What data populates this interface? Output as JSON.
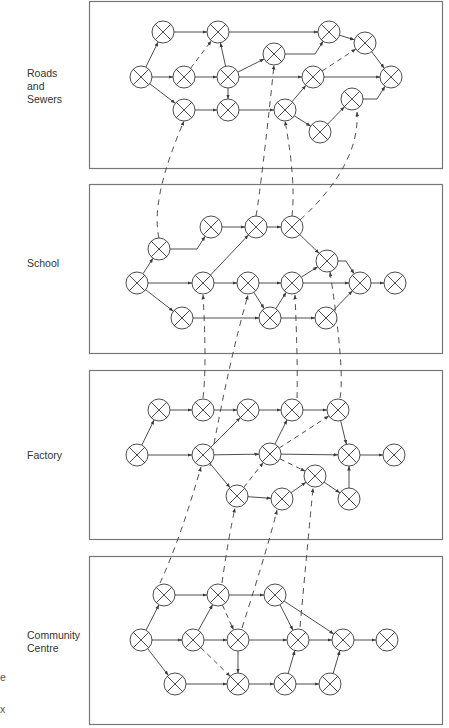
{
  "panels": [
    {
      "id": "roads",
      "label_lines": [
        "Roads",
        "and",
        "Sewers"
      ],
      "box": [
        89,
        1,
        353,
        167
      ],
      "label_pos": [
        27,
        67
      ],
      "nodes": {
        "A": [
          141,
          77
        ],
        "B": [
          163,
          32
        ],
        "C": [
          218,
          32
        ],
        "D": [
          184,
          77
        ],
        "E": [
          228,
          77
        ],
        "F": [
          184,
          110
        ],
        "G": [
          228,
          110
        ],
        "H": [
          274,
          54
        ],
        "I": [
          329,
          32
        ],
        "J": [
          313,
          77
        ],
        "K": [
          285,
          110
        ],
        "L": [
          365,
          43
        ],
        "M": [
          391,
          77
        ],
        "N": [
          352,
          99
        ],
        "O": [
          320,
          132
        ]
      },
      "edges": [
        [
          "A",
          "B"
        ],
        [
          "A",
          "D"
        ],
        [
          "A",
          "F"
        ],
        [
          "B",
          "C"
        ],
        [
          "D",
          "E"
        ],
        [
          "E",
          "C"
        ],
        [
          "E",
          "G"
        ],
        [
          "E",
          "H"
        ],
        [
          "E",
          "J"
        ],
        [
          "C",
          "I",
          "elbow"
        ],
        [
          "H",
          "I",
          "elbow"
        ],
        [
          "I",
          "L"
        ],
        [
          "L",
          "M"
        ],
        [
          "J",
          "M"
        ],
        [
          "F",
          "G"
        ],
        [
          "G",
          "K"
        ],
        [
          "K",
          "J"
        ],
        [
          "K",
          "O"
        ],
        [
          "O",
          "N"
        ],
        [
          "N",
          "M",
          "elbow"
        ]
      ],
      "dashed": [
        [
          "D",
          "C"
        ],
        [
          "J",
          "L"
        ]
      ]
    },
    {
      "id": "school",
      "label_lines": [
        "School"
      ],
      "box": [
        89,
        184,
        353,
        169
      ],
      "label_pos": [
        27,
        257
      ],
      "nodes": {
        "A": [
          137,
          283
        ],
        "B": [
          159,
          249
        ],
        "C": [
          182,
          318
        ],
        "D": [
          211,
          227
        ],
        "E": [
          203,
          283
        ],
        "F": [
          256,
          227
        ],
        "G": [
          248,
          283
        ],
        "H": [
          270,
          318
        ],
        "I": [
          292,
          227
        ],
        "J": [
          292,
          283
        ],
        "K": [
          327,
          261
        ],
        "L": [
          326,
          318
        ],
        "M": [
          360,
          283
        ],
        "N": [
          395,
          283
        ]
      },
      "edges": [
        [
          "A",
          "B"
        ],
        [
          "A",
          "E"
        ],
        [
          "A",
          "C"
        ],
        [
          "B",
          "D",
          "elbow"
        ],
        [
          "D",
          "F"
        ],
        [
          "F",
          "I"
        ],
        [
          "E",
          "F"
        ],
        [
          "E",
          "G"
        ],
        [
          "G",
          "J"
        ],
        [
          "G",
          "H"
        ],
        [
          "C",
          "H"
        ],
        [
          "H",
          "J"
        ],
        [
          "H",
          "L"
        ],
        [
          "J",
          "K"
        ],
        [
          "J",
          "M"
        ],
        [
          "I",
          "K"
        ],
        [
          "K",
          "M",
          "elbow"
        ],
        [
          "L",
          "M"
        ],
        [
          "M",
          "N"
        ]
      ],
      "dashed": []
    },
    {
      "id": "factory",
      "label_lines": [
        "Factory"
      ],
      "box": [
        89,
        370,
        353,
        169
      ],
      "label_pos": [
        27,
        449
      ],
      "nodes": {
        "A": [
          137,
          455
        ],
        "B": [
          159,
          410
        ],
        "C": [
          203,
          410
        ],
        "D": [
          203,
          455
        ],
        "E": [
          248,
          410
        ],
        "F": [
          237,
          496
        ],
        "G": [
          292,
          410
        ],
        "H": [
          270,
          454
        ],
        "I": [
          282,
          499
        ],
        "J": [
          338,
          410
        ],
        "K": [
          315,
          476
        ],
        "L": [
          349,
          455
        ],
        "M": [
          349,
          499
        ],
        "N": [
          394,
          455
        ]
      },
      "edges": [
        [
          "A",
          "B"
        ],
        [
          "A",
          "D"
        ],
        [
          "B",
          "C"
        ],
        [
          "C",
          "E"
        ],
        [
          "D",
          "E"
        ],
        [
          "D",
          "H"
        ],
        [
          "D",
          "F"
        ],
        [
          "E",
          "G"
        ],
        [
          "G",
          "J"
        ],
        [
          "H",
          "G"
        ],
        [
          "H",
          "L"
        ],
        [
          "J",
          "L"
        ],
        [
          "F",
          "I"
        ],
        [
          "I",
          "K"
        ],
        [
          "K",
          "M"
        ],
        [
          "M",
          "L"
        ],
        [
          "L",
          "N"
        ]
      ],
      "dashed": [
        [
          "H",
          "J"
        ],
        [
          "H",
          "K"
        ],
        [
          "F",
          "H"
        ]
      ]
    },
    {
      "id": "community",
      "label_lines": [
        "Community",
        "Centre"
      ],
      "box": [
        89,
        556,
        353,
        168
      ],
      "label_pos": [
        27,
        629
      ],
      "nodes": {
        "A": [
          141,
          640
        ],
        "B": [
          164,
          595
        ],
        "C": [
          175,
          684
        ],
        "D": [
          193,
          640
        ],
        "E": [
          218,
          595
        ],
        "F": [
          238,
          640
        ],
        "G": [
          238,
          684
        ],
        "H": [
          275,
          595
        ],
        "I": [
          285,
          684
        ],
        "J": [
          298,
          640
        ],
        "K": [
          330,
          684
        ],
        "L": [
          343,
          640
        ],
        "M": [
          387,
          640
        ]
      },
      "edges": [
        [
          "A",
          "B"
        ],
        [
          "A",
          "D"
        ],
        [
          "A",
          "C"
        ],
        [
          "B",
          "E"
        ],
        [
          "D",
          "E"
        ],
        [
          "D",
          "F"
        ],
        [
          "E",
          "H"
        ],
        [
          "F",
          "G"
        ],
        [
          "F",
          "J"
        ],
        [
          "C",
          "G"
        ],
        [
          "G",
          "I"
        ],
        [
          "I",
          "J"
        ],
        [
          "I",
          "K"
        ],
        [
          "K",
          "L"
        ],
        [
          "H",
          "J"
        ],
        [
          "H",
          "L"
        ],
        [
          "J",
          "L"
        ],
        [
          "L",
          "M"
        ]
      ],
      "dashed": [
        [
          "E",
          "F"
        ],
        [
          "D",
          "G"
        ]
      ]
    }
  ],
  "cross_links": [
    [
      [
        159,
        238
      ],
      [
        150,
        200
      ],
      [
        184,
        121
      ]
    ],
    [
      [
        256,
        216
      ],
      [
        262,
        180
      ],
      [
        274,
        65
      ]
    ],
    [
      [
        292,
        216
      ],
      [
        296,
        180
      ],
      [
        285,
        121
      ]
    ],
    [
      [
        300,
        220
      ],
      [
        360,
        165
      ],
      [
        357,
        112
      ]
    ],
    [
      [
        203,
        398
      ],
      [
        207,
        365
      ],
      [
        203,
        295
      ]
    ],
    [
      [
        210,
        466
      ],
      [
        228,
        365
      ],
      [
        248,
        295
      ]
    ],
    [
      [
        297,
        398
      ],
      [
        298,
        365
      ],
      [
        295,
        295
      ]
    ],
    [
      [
        340,
        398
      ],
      [
        345,
        370
      ],
      [
        330,
        272
      ]
    ],
    [
      [
        160,
        583
      ],
      [
        180,
        540
      ],
      [
        201,
        467
      ]
    ],
    [
      [
        222,
        583
      ],
      [
        228,
        540
      ],
      [
        235,
        508
      ]
    ],
    [
      [
        242,
        628
      ],
      [
        270,
        540
      ],
      [
        277,
        510
      ]
    ],
    [
      [
        300,
        627
      ],
      [
        308,
        540
      ],
      [
        313,
        488
      ]
    ]
  ],
  "edge_fragments": [
    {
      "text": "e",
      "x": 0,
      "y": 671
    },
    {
      "text": "x",
      "x": 0,
      "y": 703
    }
  ],
  "colors": {
    "line": "#3a3a3a",
    "box": "#777777",
    "text": "#333333"
  }
}
